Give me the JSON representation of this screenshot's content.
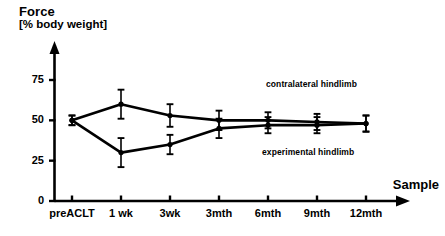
{
  "chart_data": {
    "type": "line",
    "title": "Force",
    "subtitle": "[% body weight]",
    "ylabel": "Force [% body weight]",
    "xlabel": "Sample",
    "categories": [
      "preACLT",
      "1 wk",
      "3wk",
      "3mth",
      "6mth",
      "9mth",
      "12mth"
    ],
    "ylim": [
      0,
      85
    ],
    "yticks": [
      0,
      25,
      50,
      75
    ],
    "ytick_labels": [
      "0",
      "25",
      "50",
      "75"
    ],
    "xtick_labels": [
      "preACLT",
      "1 wk",
      "3wk",
      "3mth",
      "6mth",
      "9mth",
      "12mth"
    ],
    "grid": false,
    "legend": "annotations",
    "series": [
      {
        "name": "contralateral hindlimb",
        "values": [
          50,
          60,
          53,
          50,
          50,
          49,
          48
        ],
        "errors": [
          3,
          9,
          7,
          6,
          5,
          5,
          5
        ],
        "marker": "filled-circle",
        "color": "#000000"
      },
      {
        "name": "experimental hindlimb",
        "values": [
          50,
          30,
          35,
          45,
          47,
          47,
          48
        ],
        "errors": [
          3,
          9,
          6,
          6,
          5,
          5,
          5
        ],
        "marker": "filled-circle",
        "color": "#000000"
      }
    ],
    "annotations": [
      {
        "text": "contralateral hindlimb",
        "x": 266,
        "y": 79
      },
      {
        "text": "experimental hindlimb",
        "x": 262,
        "y": 147
      }
    ]
  },
  "axes": {
    "y_tick_values": [
      "75",
      "50",
      "25",
      "0"
    ],
    "x_tick_values": [
      "preACLT",
      "1 wk",
      "3wk",
      "3mth",
      "6mth",
      "9mth",
      "12mth"
    ],
    "x_axis_label": "Sample"
  },
  "header": {
    "title": "Force",
    "units": "[% body weight]"
  },
  "colors": {
    "ink": "#000000",
    "background": "#ffffff"
  }
}
